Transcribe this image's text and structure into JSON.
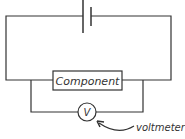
{
  "diagram": {
    "type": "circuit",
    "component_label": "Component",
    "voltmeter_symbol": "V",
    "voltmeter_annotation": "voltmeter",
    "colors": {
      "line": "#333333",
      "background": "#ffffff"
    }
  }
}
